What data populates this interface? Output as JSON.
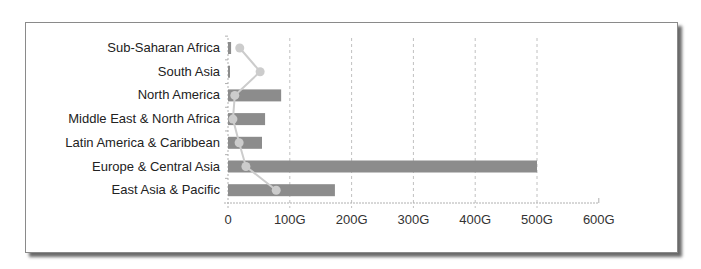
{
  "chart_data": {
    "type": "bar",
    "orientation": "horizontal",
    "title": "",
    "xlabel": "",
    "ylabel": "",
    "categories": [
      "Sub-Saharan Africa",
      "South Asia",
      "North America",
      "Middle East & North Africa",
      "Latin America & Caribbean",
      "Europe & Central Asia",
      "East Asia & Pacific"
    ],
    "series": [
      {
        "name": "bar",
        "type": "bar",
        "color": "#8c8c8c",
        "values": [
          5,
          2,
          86,
          60,
          55,
          500,
          173
        ]
      },
      {
        "name": "line",
        "type": "line",
        "color": "#c8c8c8",
        "values": [
          19,
          52,
          11,
          8,
          18,
          29,
          78
        ]
      }
    ],
    "xlim": [
      0,
      600
    ],
    "xticks": [
      "0",
      "100G",
      "200G",
      "300G",
      "400G",
      "500G",
      "600G"
    ],
    "xtick_values": [
      0,
      100,
      200,
      300,
      400,
      500,
      600
    ],
    "grid": "vertical dashed",
    "legend": "none"
  },
  "colors": {
    "bar": "#8c8c8c",
    "line": "#cccccc",
    "grid": "#c0c0c0",
    "axis": "#b0b0b0",
    "text": "#222222"
  }
}
